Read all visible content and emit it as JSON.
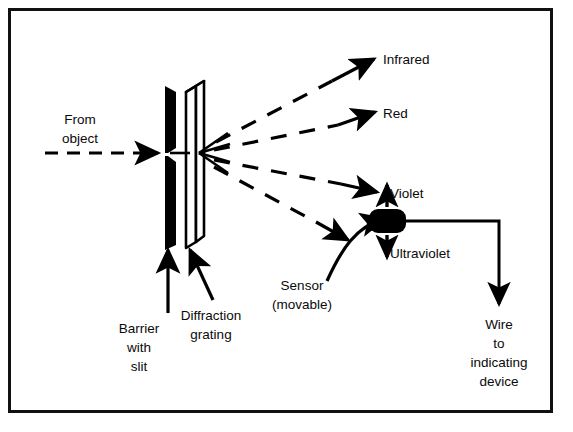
{
  "figure": {
    "background_color": "#ffffff",
    "ink_color": "#000000",
    "frame": {
      "x": 8,
      "y": 8,
      "width": 544,
      "height": 404,
      "stroke_width": 3
    }
  },
  "labels": {
    "from_object_line1": "From",
    "from_object_line2": "object",
    "infrared": "Infrared",
    "red": "Red",
    "violet": "Violet",
    "ultraviolet": "Ultraviolet",
    "sensor_line1": "Sensor",
    "sensor_line2": "(movable)",
    "barrier_line1": "Barrier",
    "barrier_line2": "with",
    "barrier_line3": "slit",
    "grating_line1": "Diffraction",
    "grating_line2": "grating",
    "wire_line1": "Wire",
    "wire_line2": "to",
    "wire_line3": "indicating",
    "wire_line4": "device"
  },
  "components": {
    "barrier": {
      "name": "barrier-with-slit",
      "fill": "#000000"
    },
    "grating": {
      "name": "diffraction-grating",
      "fill": "#ffffff",
      "stroke": "#000000"
    },
    "sensor": {
      "name": "sensor-block",
      "fill": "#000000"
    },
    "wire": {
      "name": "wire-to-indicating-device",
      "stroke": "#000000"
    }
  },
  "rays": {
    "incoming": {
      "style": "dashed",
      "label": "from object beam"
    },
    "diffracted": [
      {
        "label": "Infrared",
        "style": "dashed",
        "angle_deg": 28
      },
      {
        "label": "Red",
        "style": "dashed",
        "angle_deg": 15
      },
      {
        "label": "Violet",
        "style": "dashed",
        "angle_deg": -11
      },
      {
        "label": "Ultraviolet",
        "style": "dashed",
        "angle_deg": -20
      }
    ]
  }
}
